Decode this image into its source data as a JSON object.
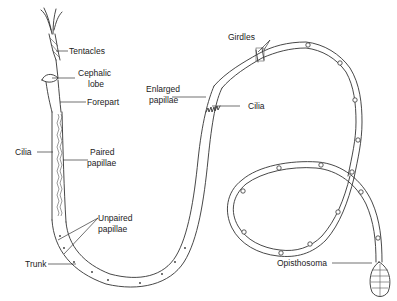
{
  "diagram": {
    "colors": {
      "line": "#333333",
      "background": "#ffffff",
      "text": "#222222"
    },
    "labels": {
      "tentacles": "Tentacles",
      "cephalic_lobe_1": "Cephalic",
      "cephalic_lobe_2": "lobe",
      "forepart": "Forepart",
      "cilia_left": "Cilia",
      "paired_papillae_1": "Paired",
      "paired_papillae_2": "papillae",
      "unpaired_papillae_1": "Unpaired",
      "unpaired_papillae_2": "papillae",
      "trunk": "Trunk",
      "girdles": "Girdles",
      "enlarged_papillae_1": "Enlarged",
      "enlarged_papillae_2": "papillae",
      "cilia_right": "Cilia",
      "opisthosoma": "Opisthosoma"
    }
  }
}
